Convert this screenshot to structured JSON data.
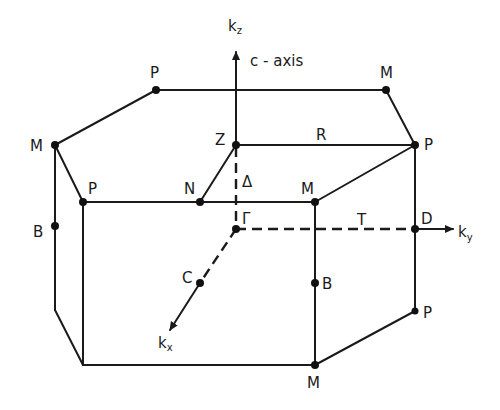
{
  "diagram": {
    "axes": {
      "kz": {
        "label": "k",
        "sub": "z",
        "annotation": "c - axis"
      },
      "ky": {
        "label": "k",
        "sub": "y"
      },
      "kx": {
        "label": "k",
        "sub": "x"
      }
    },
    "points": {
      "P_top_back": "P",
      "M_top_back": "M",
      "M_left": "M",
      "Z": "Z",
      "R": "R",
      "P_right": "P",
      "P_front_left": "P",
      "N": "N",
      "Delta": "Δ",
      "M_front": "M",
      "Gamma": "Γ",
      "T": "T",
      "D": "D",
      "B_left": "B",
      "C": "C",
      "B_front": "B",
      "P_lower_right": "P",
      "M_bottom": "M"
    },
    "colors": {
      "line": "#1a1a1a",
      "background": "#ffffff"
    }
  }
}
